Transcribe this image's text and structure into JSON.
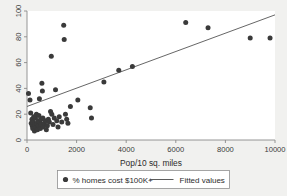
{
  "chart_data": {
    "type": "scatter",
    "title": "",
    "xlabel": "Pop/10 sq. miles",
    "ylabel": "",
    "xlim": [
      0,
      10000
    ],
    "ylim": [
      0,
      100
    ],
    "xticks": [
      0,
      2000,
      4000,
      6000,
      8000,
      10000
    ],
    "yticks": [
      0,
      20,
      40,
      60,
      80,
      100
    ],
    "xtick_labels": [
      "0",
      "2000",
      "4000",
      "6000",
      "8000",
      "10000"
    ],
    "ytick_labels": [
      "0",
      "20",
      "40",
      "60",
      "80",
      "100"
    ],
    "grid": false,
    "legend_position": "bottom",
    "series": [
      {
        "name": "% homes cost $100K+",
        "type": "scatter",
        "marker": "filled-circle",
        "color": "#3a3a3a",
        "points": [
          [
            60,
            36
          ],
          [
            120,
            31
          ],
          [
            150,
            21
          ],
          [
            170,
            13
          ],
          [
            200,
            16
          ],
          [
            210,
            11
          ],
          [
            230,
            9
          ],
          [
            250,
            14
          ],
          [
            270,
            18
          ],
          [
            300,
            7
          ],
          [
            320,
            12
          ],
          [
            340,
            17
          ],
          [
            360,
            10
          ],
          [
            380,
            20
          ],
          [
            400,
            13
          ],
          [
            420,
            8
          ],
          [
            440,
            15
          ],
          [
            460,
            11
          ],
          [
            480,
            19
          ],
          [
            500,
            32
          ],
          [
            520,
            14
          ],
          [
            540,
            9
          ],
          [
            560,
            16
          ],
          [
            580,
            12
          ],
          [
            600,
            44
          ],
          [
            620,
            38
          ],
          [
            640,
            17
          ],
          [
            660,
            10
          ],
          [
            700,
            13
          ],
          [
            740,
            15
          ],
          [
            780,
            8
          ],
          [
            820,
            11
          ],
          [
            860,
            16
          ],
          [
            900,
            14
          ],
          [
            950,
            22
          ],
          [
            980,
            65
          ],
          [
            1000,
            20
          ],
          [
            1050,
            12
          ],
          [
            1100,
            17
          ],
          [
            1150,
            39
          ],
          [
            1200,
            15
          ],
          [
            1250,
            10
          ],
          [
            1300,
            18
          ],
          [
            1400,
            14
          ],
          [
            1480,
            89
          ],
          [
            1500,
            78
          ],
          [
            1550,
            20
          ],
          [
            1600,
            16
          ],
          [
            1650,
            13
          ],
          [
            1750,
            26
          ],
          [
            2050,
            31
          ],
          [
            2550,
            25
          ],
          [
            2600,
            17
          ],
          [
            3100,
            45
          ],
          [
            3700,
            54
          ],
          [
            4250,
            57
          ],
          [
            6400,
            91
          ],
          [
            7300,
            87
          ],
          [
            9000,
            79
          ],
          [
            9800,
            79
          ]
        ]
      },
      {
        "name": "Fitted values",
        "type": "line",
        "color": "#4a4a4a",
        "line": {
          "x0": 0,
          "y0": 26,
          "x1": 10000,
          "y1": 97
        }
      }
    ]
  },
  "legend": {
    "entries": [
      {
        "label": "% homes cost $100K+",
        "symbol": "filled-circle"
      },
      {
        "label": "Fitted values",
        "symbol": "line"
      }
    ]
  }
}
